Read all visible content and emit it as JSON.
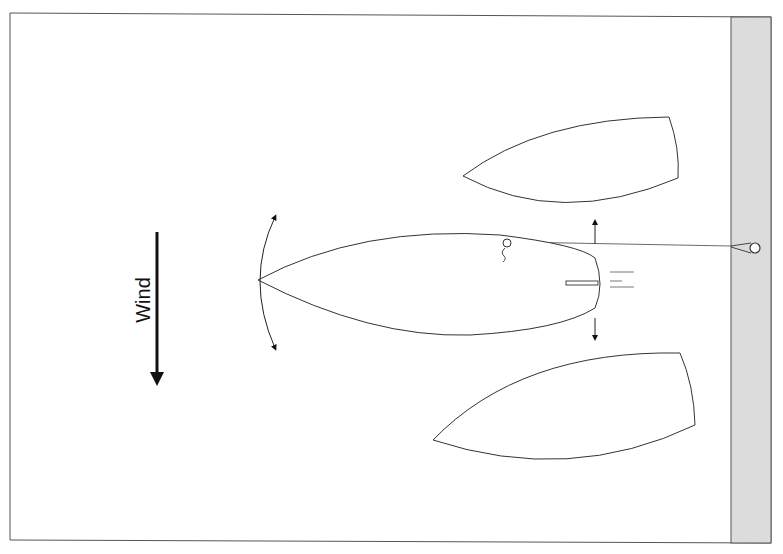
{
  "diagram": {
    "wind": {
      "label": "Wind",
      "direction": "down",
      "icon": "wind-arrow-icon"
    },
    "dock": {
      "label": "",
      "color": "#dcdcdc",
      "icon": "mooring-ring-icon"
    },
    "boats": [
      {
        "id": "boat-top",
        "role": "alternate-position-port"
      },
      {
        "id": "boat-center",
        "role": "start-position"
      },
      {
        "id": "boat-bottom",
        "role": "alternate-position-starboard"
      }
    ],
    "annotations": {
      "bow_swing_arrows": "bow swings either way",
      "stern_arrows": "stern pushed off",
      "bow_line": "line to dock ring"
    },
    "colors": {
      "line": "#333333",
      "fill": "#ffffff",
      "dock": "#dcdcdc",
      "arrow": "#111111"
    }
  }
}
